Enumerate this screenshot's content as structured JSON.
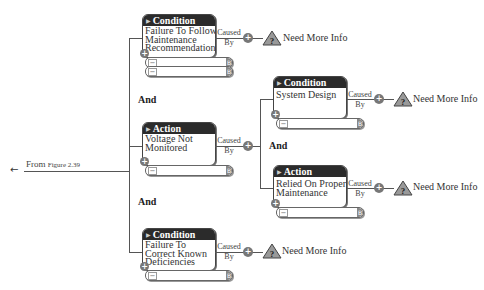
{
  "entry": {
    "arrow_icon": "left-arrow",
    "label_prefix": "From",
    "label_ref": "Figure 2.39"
  },
  "connectors": {
    "and_label": "And",
    "caused_label": "Caused",
    "by_label": "By"
  },
  "cards": [
    {
      "type": "Condition",
      "lines": [
        "Failure To Follow",
        "Maintenance",
        "Recommendations"
      ],
      "input_rows": 2,
      "outcome": "Need More Info"
    },
    {
      "type": "Action",
      "lines": [
        "Voltage Not",
        "Monitored"
      ],
      "input_rows": 1
    },
    {
      "type": "Condition",
      "lines": [
        "Failure To",
        "Correct Known",
        "Deficiencies"
      ],
      "input_rows": 1,
      "outcome": "Need More Info"
    },
    {
      "type": "Condition",
      "lines": [
        "System Design"
      ],
      "input_rows": 1,
      "outcome": "Need More Info"
    },
    {
      "type": "Action",
      "lines": [
        "Relied On Proper",
        "Maintenance"
      ],
      "input_rows": 1,
      "outcome": "Need More Info"
    }
  ],
  "icons": {
    "expand": "+",
    "collapse": "−",
    "triangle": "▶",
    "warning": "?",
    "arrow": "←",
    "cap": "B"
  },
  "colors": {
    "header_bg": "#2b2b2b",
    "line": "#555555",
    "node": "#777777",
    "warning_fill": "#999999"
  }
}
